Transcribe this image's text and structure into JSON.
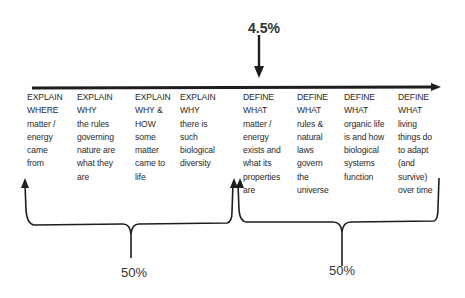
{
  "top_marker": {
    "label": "4.5%"
  },
  "columns": [
    {
      "lines": [
        "EXPLAIN",
        "WHERE",
        "matter /",
        "energy",
        "came",
        "from"
      ]
    },
    {
      "lines": [
        "EXPLAIN",
        "WHY",
        "the rules",
        "governing",
        "nature are",
        "what they",
        "are"
      ]
    },
    {
      "lines": [
        "EXPLAIN",
        "WHY &",
        "HOW",
        "some",
        "matter",
        "came to",
        "life"
      ]
    },
    {
      "lines": [
        "EXPLAIN",
        "WHY",
        "there is",
        "such",
        "biological",
        "diversity"
      ]
    },
    {
      "lines": [
        "DEFINE",
        "WHAT",
        "matter /",
        "energy",
        "exists and",
        "what its",
        "properties",
        "are"
      ]
    },
    {
      "lines": [
        "DEFINE",
        "WHAT",
        "rules &",
        "natural",
        "laws",
        "govern",
        "the",
        "universe"
      ]
    },
    {
      "lines": [
        "DEFINE",
        "WHAT",
        "organic life",
        "is and how",
        "biological",
        "systems",
        "function"
      ]
    },
    {
      "lines": [
        "DEFINE",
        "WHAT",
        "living",
        "things do",
        "to adapt",
        "(and",
        "survive)",
        "over time"
      ]
    }
  ],
  "brackets": [
    {
      "group": "EXPLAIN",
      "label": "50%"
    },
    {
      "group": "DEFINE",
      "label": "50%"
    }
  ],
  "colors": {
    "line": "#1e1e1e",
    "text": "#2a2a2a"
  }
}
